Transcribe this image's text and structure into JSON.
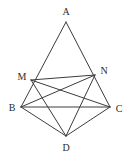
{
  "figure": {
    "kind": "geometry-diagram",
    "background_color": "#ffffff",
    "stroke_color": "#3c3c3c",
    "label_color": "#2b2b2b",
    "canvas": {
      "width": 128,
      "height": 159
    }
  },
  "labels": {
    "A": "A",
    "B": "B",
    "C": "C",
    "D": "D",
    "M": "M",
    "N": "N"
  },
  "points": {
    "A": {
      "x": 66,
      "y": 22,
      "label_x": 66,
      "label_y": 12
    },
    "B": {
      "x": 21,
      "y": 107,
      "label_x": 12,
      "label_y": 108
    },
    "C": {
      "x": 110,
      "y": 107,
      "label_x": 119,
      "label_y": 109
    },
    "D": {
      "x": 66,
      "y": 136,
      "label_x": 66,
      "label_y": 148
    },
    "M": {
      "x": 31,
      "y": 80,
      "label_x": 22,
      "label_y": 77
    },
    "N": {
      "x": 95,
      "y": 75,
      "label_x": 104,
      "label_y": 71
    }
  },
  "segments": [
    {
      "name": "A-B",
      "from": "A",
      "to": "B"
    },
    {
      "name": "A-C",
      "from": "A",
      "to": "C"
    },
    {
      "name": "B-C",
      "from": "B",
      "to": "C"
    },
    {
      "name": "M-N",
      "from": "M",
      "to": "N"
    },
    {
      "name": "M-C",
      "from": "M",
      "to": "C"
    },
    {
      "name": "N-B",
      "from": "N",
      "to": "B"
    },
    {
      "name": "M-D",
      "from": "M",
      "to": "D"
    },
    {
      "name": "N-D",
      "from": "N",
      "to": "D"
    },
    {
      "name": "B-D",
      "from": "B",
      "to": "D"
    },
    {
      "name": "C-D",
      "from": "C",
      "to": "D"
    }
  ]
}
